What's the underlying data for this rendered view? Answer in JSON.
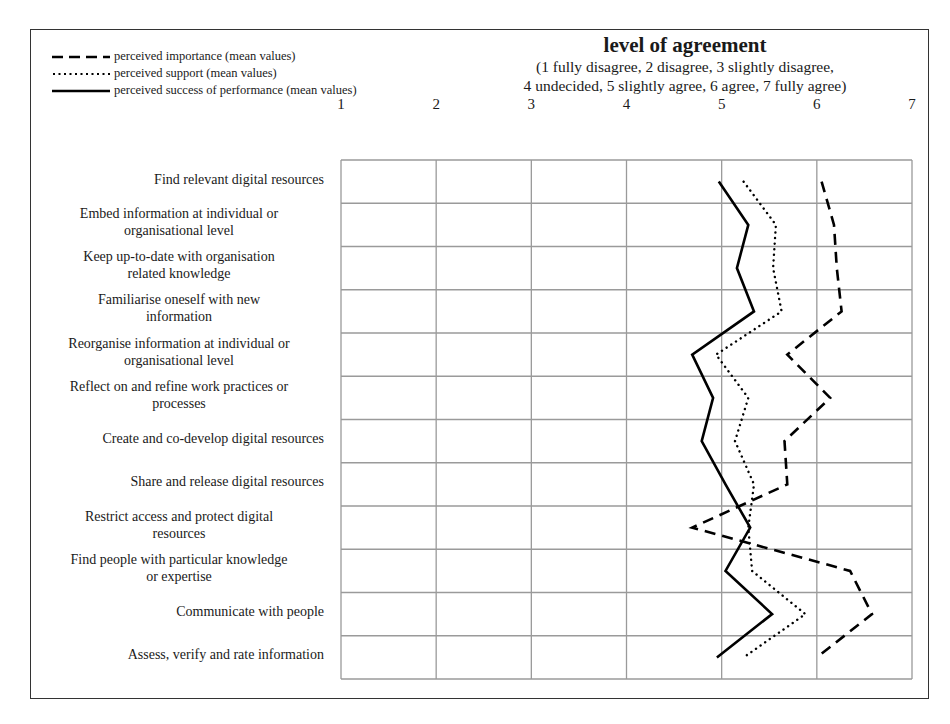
{
  "chart_data": {
    "type": "line",
    "orientation": "horizontal-categories",
    "title": "level of agreement",
    "subtitle_lines": [
      "(1 fully disagree, 2 disagree, 3 slightly disagree,",
      "4 undecided, 5 slightly agree, 6 agree, 7 fully agree)"
    ],
    "xlabel": "level of agreement",
    "ylabel": "",
    "xlim": [
      1,
      7
    ],
    "x_ticks": [
      "1",
      "2",
      "3",
      "4",
      "5",
      "6",
      "7"
    ],
    "grid": true,
    "legend_position": "top-left",
    "categories": [
      "Find relevant digital resources",
      "Embed information at individual or organisational level",
      "Keep up-to-date with organisation related knowledge",
      "Familiarise oneself with new information",
      "Reorganise information at individual or organisational level",
      "Reflect on and refine work practices or processes",
      "Create and co-develop digital resources",
      "Share and release digital resources",
      "Restrict access and protect digital resources",
      "Find people with particular knowledge or expertise",
      "Communicate with people",
      "Assess, verify and rate information"
    ],
    "series": [
      {
        "name": "perceived importance (mean values)",
        "style": "dashed",
        "values": [
          6.05,
          6.18,
          6.21,
          6.26,
          5.69,
          6.14,
          5.66,
          5.69,
          4.69,
          6.35,
          6.58,
          6.0
        ]
      },
      {
        "name": "perceived support (mean values)",
        "style": "dotted",
        "values": [
          5.23,
          5.57,
          5.54,
          5.63,
          4.94,
          5.28,
          5.14,
          5.34,
          5.28,
          5.32,
          5.88,
          5.23
        ]
      },
      {
        "name": "perceived success of performance (mean values)",
        "style": "solid",
        "values": [
          4.97,
          5.28,
          5.16,
          5.34,
          4.69,
          4.91,
          4.79,
          5.04,
          5.3,
          5.04,
          5.53,
          4.95
        ]
      }
    ]
  },
  "legend": {
    "items": [
      {
        "label": "perceived importance (mean values)",
        "style": "dashed"
      },
      {
        "label": "perceived support (mean values)",
        "style": "dotted"
      },
      {
        "label": "perceived success of performance (mean values)",
        "style": "solid"
      }
    ]
  },
  "header": {
    "title": "level of agreement",
    "subtitle_line1": "(1 fully disagree, 2 disagree, 3 slightly disagree,",
    "subtitle_line2": "4 undecided, 5 slightly agree, 6 agree, 7 fully agree)"
  },
  "rows": [
    {
      "line1": "Find relevant digital resources",
      "line2": ""
    },
    {
      "line1": "Embed information at individual or",
      "line2": "organisational level"
    },
    {
      "line1": "Keep up-to-date with organisation",
      "line2": "related knowledge"
    },
    {
      "line1": "Familiarise oneself with new",
      "line2": "information"
    },
    {
      "line1": "Reorganise information at individual or",
      "line2": "organisational level"
    },
    {
      "line1": "Reflect on and refine work practices or",
      "line2": "processes"
    },
    {
      "line1": "Create and co-develop digital resources",
      "line2": ""
    },
    {
      "line1": "Share and release digital resources",
      "line2": ""
    },
    {
      "line1": "Restrict access and protect digital",
      "line2": "resources"
    },
    {
      "line1": "Find people with particular knowledge",
      "line2": "or expertise"
    },
    {
      "line1": "Communicate with people",
      "line2": ""
    },
    {
      "line1": "Assess, verify and rate information",
      "line2": ""
    }
  ],
  "colors": {
    "line": "#000000",
    "grid": "#9a9a9a",
    "frame": "#333333"
  }
}
